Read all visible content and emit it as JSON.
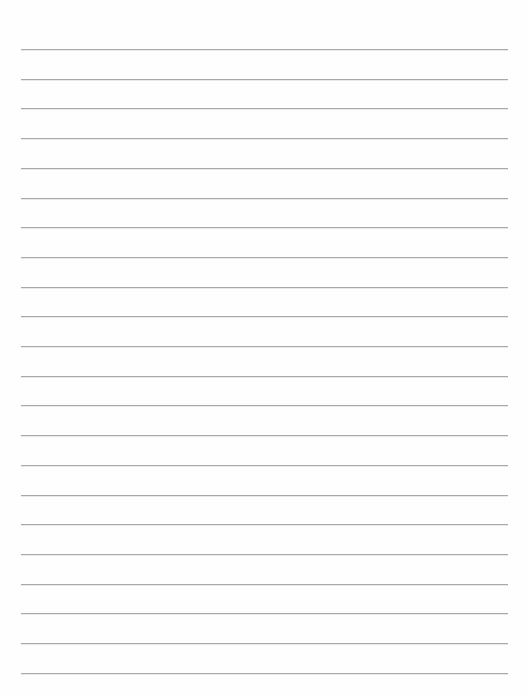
{
  "page": {
    "type": "lined-paper",
    "background_color": "#fefefe",
    "line_color": "#a9a9a9",
    "line_count": 22,
    "first_line_y": 49,
    "line_spacing": 29.7,
    "line_left": 21,
    "line_right": 508
  }
}
